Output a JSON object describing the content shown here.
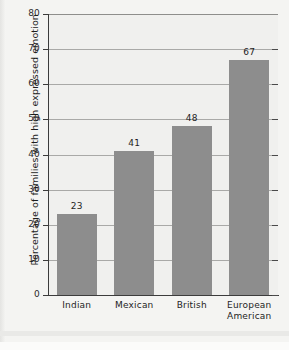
{
  "chart_data": {
    "type": "bar",
    "title": "",
    "subtitle": "",
    "xlabel": "",
    "ylabel": "Percentage of families with high expressed emotion",
    "categories": [
      "Indian",
      "Mexican",
      "British",
      "European American"
    ],
    "category_lines": [
      [
        "Indian"
      ],
      [
        "Mexican"
      ],
      [
        "British"
      ],
      [
        "European",
        "American"
      ]
    ],
    "values": [
      23,
      41,
      48,
      67
    ],
    "value_labels": [
      "23",
      "41",
      "48",
      "67"
    ],
    "ylim": [
      0,
      80
    ],
    "yticks": [
      0,
      10,
      20,
      30,
      40,
      50,
      60,
      70,
      80
    ],
    "ytick_labels": [
      "0",
      "10",
      "20",
      "30",
      "40",
      "50",
      "60",
      "70",
      "80"
    ],
    "grid": true,
    "grid_axis": "y",
    "legend": "none",
    "bar_color": "#8d8d8d",
    "plot_background": "#f0f0ee",
    "axis_color": "#3c3c3c",
    "grid_color": "#a9a9a7",
    "text_color": "#1e1e1e"
  }
}
